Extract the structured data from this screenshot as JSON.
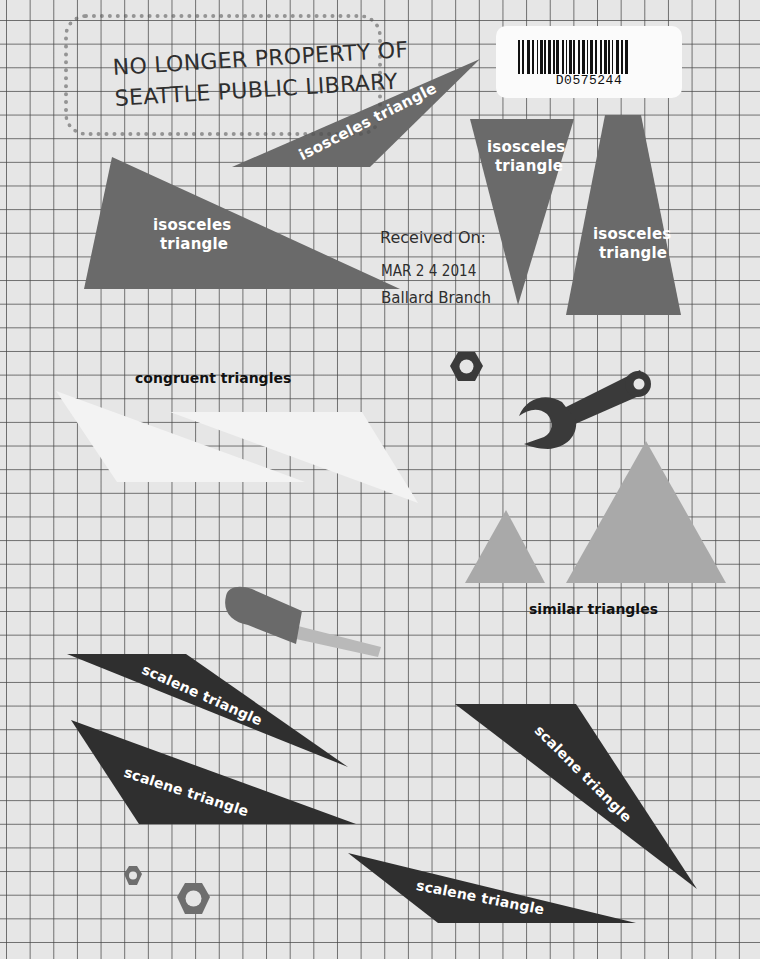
{
  "stamps": {
    "withdrawn_line1": "NO LONGER PROPERTY OF",
    "withdrawn_line2": "SEATTLE PUBLIC LIBRARY",
    "received_label": "Received On:",
    "received_date": "MAR 2 4 2014",
    "branch": "Ballard Branch"
  },
  "barcode": {
    "number": "D0575244"
  },
  "labels": {
    "isosceles_diagonal": "isosceles triangle",
    "isosceles_large_line1": "isosceles",
    "isosceles_large_line2": "triangle",
    "isosceles_down_line1": "isosceles",
    "isosceles_down_line2": "triangle",
    "isosceles_tall_line1": "isosceles",
    "isosceles_tall_line2": "triangle",
    "congruent": "congruent triangles",
    "similar": "similar triangles",
    "scalene_1": "scalene triangle",
    "scalene_2": "scalene triangle",
    "scalene_3": "scalene triangle",
    "scalene_4": "scalene triangle"
  },
  "colors": {
    "grid_background": "#e6e6e6",
    "grid_line": "#464646",
    "isosceles_fill": "#6a6a6a",
    "congruent_fill": "#f2f2f2",
    "similar_fill": "#a9a9a9",
    "scalene_fill": "#2f2f2f",
    "tool_dark": "#3a3a3a",
    "nut_gray": "#6e6e6e"
  }
}
